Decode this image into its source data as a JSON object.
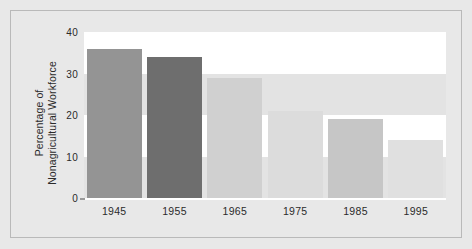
{
  "chart_data": {
    "type": "bar",
    "title": "",
    "subtitle": "",
    "xlabel": "",
    "ylabel": "Percentage of\nNonagricultural Workforce",
    "categories": [
      "1945",
      "1955",
      "1965",
      "1975",
      "1985",
      "1995"
    ],
    "values": [
      36,
      34,
      29,
      21,
      19,
      14
    ],
    "bar_colors": [
      "#949494",
      "#6e6e6e",
      "#d0d0d0",
      "#dcdcdc",
      "#c6c6c6",
      "#e0e0e0"
    ],
    "ylim": [
      0,
      40
    ],
    "yticks": [
      "0",
      "10",
      "20",
      "30",
      "40"
    ],
    "ytick_values": [
      0,
      10,
      20,
      30,
      40
    ],
    "grid": "alternating-horizontal-bands",
    "band_colors": [
      "#ffffff",
      "#e3e3e3"
    ],
    "legend": "none",
    "background_color": "#e8e8e8",
    "frame_color": "#b9b9b9",
    "axis_line_color": "#ffffff",
    "text_color": "#2b2b2b"
  }
}
